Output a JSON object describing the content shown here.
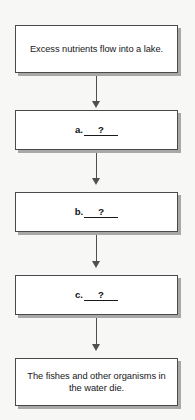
{
  "diagram": {
    "background_color": "#f7f7f5",
    "box_fill_color": "#ffffff",
    "box_border_color": "#4a4a4a",
    "box_shadow_color": "#a8a8a8",
    "arrow_color": "#4f4f52",
    "nodes": [
      {
        "id": "node-1",
        "kind": "sentence",
        "text": "Excess nutrients flow into a lake."
      },
      {
        "id": "node-2",
        "kind": "blank",
        "label": "a.",
        "slot_value": "?"
      },
      {
        "id": "node-3",
        "kind": "blank",
        "label": "b.",
        "slot_value": "?"
      },
      {
        "id": "node-4",
        "kind": "blank",
        "label": "c.",
        "slot_value": "?"
      },
      {
        "id": "node-5",
        "kind": "sentence",
        "text": "The fishes and other organisms in the water die."
      }
    ],
    "arrows": [
      {
        "id": "arrow-1",
        "from": "node-1",
        "to": "node-2",
        "direction": "down"
      },
      {
        "id": "arrow-2",
        "from": "node-2",
        "to": "node-3",
        "direction": "down"
      },
      {
        "id": "arrow-3",
        "from": "node-3",
        "to": "node-4",
        "direction": "down"
      },
      {
        "id": "arrow-4",
        "from": "node-4",
        "to": "node-5",
        "direction": "down"
      }
    ]
  }
}
